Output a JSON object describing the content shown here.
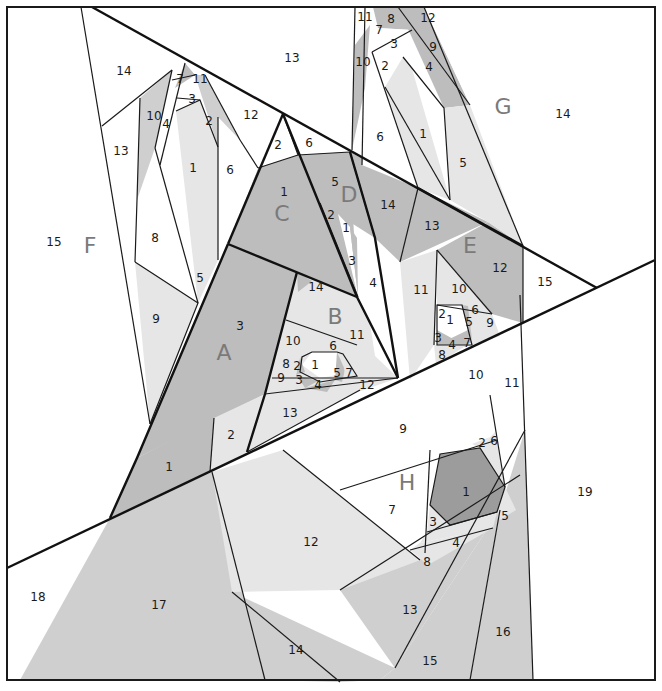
{
  "diagram": {
    "type": "foundation paper piecing pattern",
    "colors": {
      "white": "#ffffff",
      "light": "#e6e6e6",
      "medium": "#cfcfcf",
      "dark": "#bdbdbd",
      "darkest": "#9c9c9c",
      "line": "#1a1a1a",
      "section_letter": "#7a7a7a"
    },
    "sections": {
      "A": {
        "letter": "A",
        "pieces": {
          "p1": "1",
          "p2": "2",
          "p3": "3"
        }
      },
      "B": {
        "letter": "B",
        "pieces": {
          "p1": "1",
          "p2": "2",
          "p3": "3",
          "p4": "4",
          "p5": "5",
          "p6": "6",
          "p7": "7",
          "p8": "8",
          "p9": "9",
          "p10": "10",
          "p11": "11",
          "p12": "12",
          "p13": "13",
          "p14": "14"
        }
      },
      "C": {
        "letter": "C",
        "pieces": {
          "p1": "1",
          "p2": "2",
          "p6": "6"
        }
      },
      "D": {
        "letter": "D",
        "pieces": {
          "p1": "1",
          "p2": "2",
          "p3": "3",
          "p4": "4",
          "p5": "5",
          "p14": "14"
        }
      },
      "E": {
        "letter": "E",
        "pieces": {
          "p1": "1",
          "p2": "2",
          "p3": "3",
          "p4": "4",
          "p5": "5",
          "p6": "6",
          "p7": "7",
          "p8": "8",
          "p9": "9",
          "p10": "10",
          "p11": "11",
          "p12": "12",
          "p13": "13",
          "p15": "15"
        }
      },
      "F": {
        "letter": "F",
        "pieces": {
          "p1": "1",
          "p2": "2",
          "p3": "3",
          "p4": "4",
          "p5": "5",
          "p6": "6",
          "p7": "7",
          "p8": "8",
          "p9": "9",
          "p10": "10",
          "p11": "11",
          "p12": "12",
          "p13": "13",
          "p14": "14",
          "p15": "15"
        }
      },
      "G": {
        "letter": "G",
        "pieces": {
          "p1": "1",
          "p2": "2",
          "p3": "3",
          "p4": "4",
          "p5": "5",
          "p6": "6",
          "p7": "7",
          "p8": "8",
          "p9": "9",
          "p10": "10",
          "p11": "11",
          "p12": "12",
          "p13": "13",
          "p14": "14"
        }
      },
      "H": {
        "letter": "H",
        "pieces": {
          "p1": "1",
          "p2": "2",
          "p3": "3",
          "p4": "4",
          "p5": "5",
          "p6": "6",
          "p7": "7",
          "p8": "8",
          "p9": "9",
          "p10": "10",
          "p11": "11",
          "p12": "12",
          "p13": "13",
          "p14": "14",
          "p15": "15",
          "p16": "16",
          "p17": "17",
          "p18": "18",
          "p19": "19"
        }
      }
    }
  }
}
